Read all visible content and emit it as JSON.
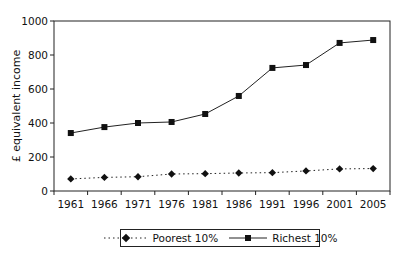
{
  "chart_data": {
    "type": "line",
    "title": "",
    "xlabel": "",
    "ylabel": "£ equivalent income",
    "ylim": [
      0,
      1000
    ],
    "yticks": [
      0,
      200,
      400,
      600,
      800,
      1000
    ],
    "grid": false,
    "legend_position": "bottom",
    "categories": [
      "1961",
      "1966",
      "1971",
      "1976",
      "1981",
      "1986",
      "1991",
      "1996",
      "2001",
      "2005"
    ],
    "series": [
      {
        "name": "Poorest 10%",
        "marker": "diamond",
        "line_style": "dotted",
        "values": [
          71,
          80,
          84,
          100,
          102,
          106,
          108,
          118,
          130,
          132
        ]
      },
      {
        "name": "Richest 10%",
        "marker": "square",
        "line_style": "solid",
        "values": [
          341,
          376,
          400,
          406,
          453,
          559,
          724,
          741,
          871,
          888
        ]
      }
    ]
  },
  "colors": {
    "line": "#222222",
    "axis": "#222222",
    "background": "#ffffff"
  }
}
